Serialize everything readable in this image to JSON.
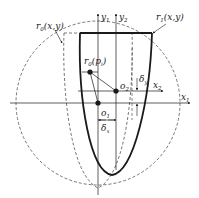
{
  "diagram": {
    "type": "geometric-schematic",
    "colors": {
      "background": "#ffffff",
      "stroke": "#1a1a1a",
      "dashed": "#555555"
    },
    "labels": {
      "r0": {
        "base": "r",
        "sub": "0",
        "args": "(x,y)"
      },
      "r1": {
        "base": "r",
        "sub": "1",
        "args": "(x,y)"
      },
      "r0pi": {
        "base": "r",
        "sub": "0",
        "args": "(p",
        "args_sub": "i",
        "args_close": ")"
      },
      "y1": {
        "base": "y",
        "sub": "1"
      },
      "y2": {
        "base": "y",
        "sub": "2"
      },
      "x1": {
        "base": "x",
        "sub": "1"
      },
      "x2": {
        "base": "x",
        "sub": "2"
      },
      "o1": {
        "base": "o",
        "sub": "1"
      },
      "o2": {
        "base": "o",
        "sub": "2"
      },
      "delta_x": {
        "base": "δ",
        "sub": "x"
      },
      "delta_y": {
        "base": "δ",
        "sub": "y"
      }
    },
    "points": {
      "o1": [
        98,
        103
      ],
      "o2": [
        116,
        91
      ],
      "p_i": [
        90,
        72
      ]
    }
  }
}
